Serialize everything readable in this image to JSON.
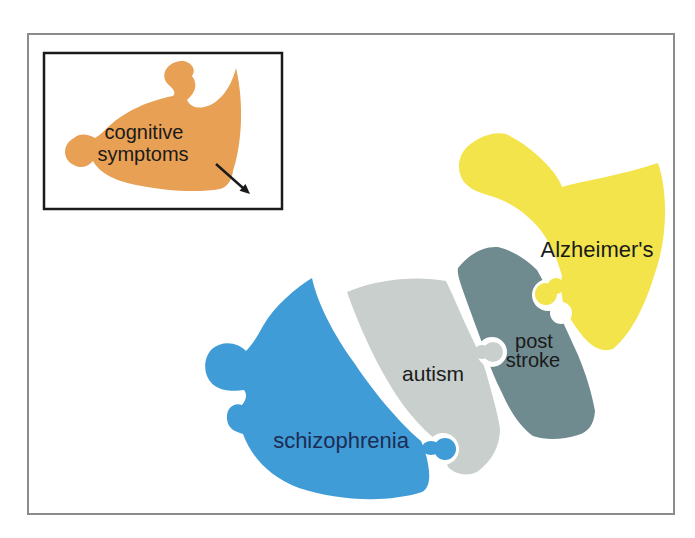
{
  "figure": {
    "legend": {
      "piece_label_line1": "cognitive",
      "piece_label_line2": "symptoms"
    },
    "pieces": {
      "schizophrenia": {
        "label": "schizophrenia"
      },
      "autism": {
        "label": "autism"
      },
      "post_stroke": {
        "label_line1": "post",
        "label_line2": "stroke"
      },
      "alzheimers": {
        "label": "Alzheimer's"
      }
    }
  },
  "colors": {
    "background": "#ffffff",
    "frame_border": "#8c8c8c",
    "legend_border": "#1a1a1a",
    "cognitive_symptoms": "#e8a054",
    "schizophrenia": "#3f9cd6",
    "autism": "#c9cfcc",
    "post_stroke": "#6f8b90",
    "alzheimers": "#f3e44c",
    "label_text": "#1a1a1a",
    "schizophrenia_text": "#1d2c55",
    "arrow": "#1a1a1a"
  }
}
